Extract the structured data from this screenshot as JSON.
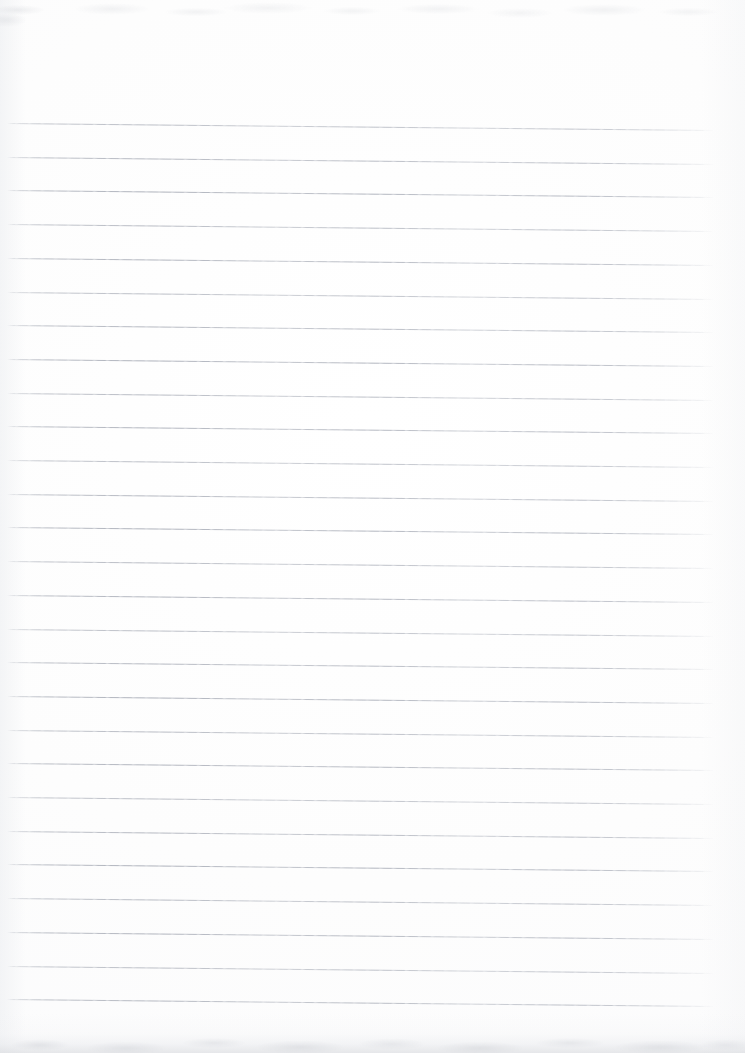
{
  "document": {
    "kind": "scanned-lined-paper",
    "title": "Blank ruled notebook page",
    "page_width": 745,
    "page_height": 1053,
    "orientation": "portrait",
    "content_text": "",
    "has_handwriting": false,
    "has_printed_text": false
  },
  "paper": {
    "background_color": "#fdfdfd",
    "edge_shadow_color": "#d8dade",
    "top_smudge_color": "#c6c9cf",
    "bottom_smudge_color": "#babdc4"
  },
  "ruling": {
    "line_color": "#b9bdc5",
    "line_thickness_px": 1,
    "line_count": 27,
    "first_line_y": 123,
    "line_spacing_px": 33.7,
    "left_x": 7,
    "right_x": 714,
    "skew_drop_px": 7,
    "skew_degrees": 0.57,
    "lines_y": [
      123,
      156.7,
      190.4,
      224.1,
      257.8,
      291.5,
      325.2,
      358.9,
      392.6,
      426.3,
      460.0,
      493.7,
      527.4,
      561.1,
      594.8,
      628.5,
      662.2,
      695.9,
      729.6,
      763.3,
      797.0,
      830.7,
      864.4,
      898.1,
      931.8,
      965.5,
      999.2
    ]
  }
}
